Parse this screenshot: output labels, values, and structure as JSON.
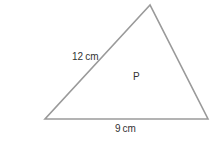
{
  "diagram": {
    "shape": "triangle",
    "vertices": {
      "top": [
        150,
        5
      ],
      "bottom_left": [
        45,
        119
      ],
      "bottom_right": [
        208,
        119
      ]
    },
    "stroke_color": "#9a9a9a",
    "labels": {
      "side_left": "12 cm",
      "side_bottom": "9 cm",
      "region": "P"
    }
  }
}
